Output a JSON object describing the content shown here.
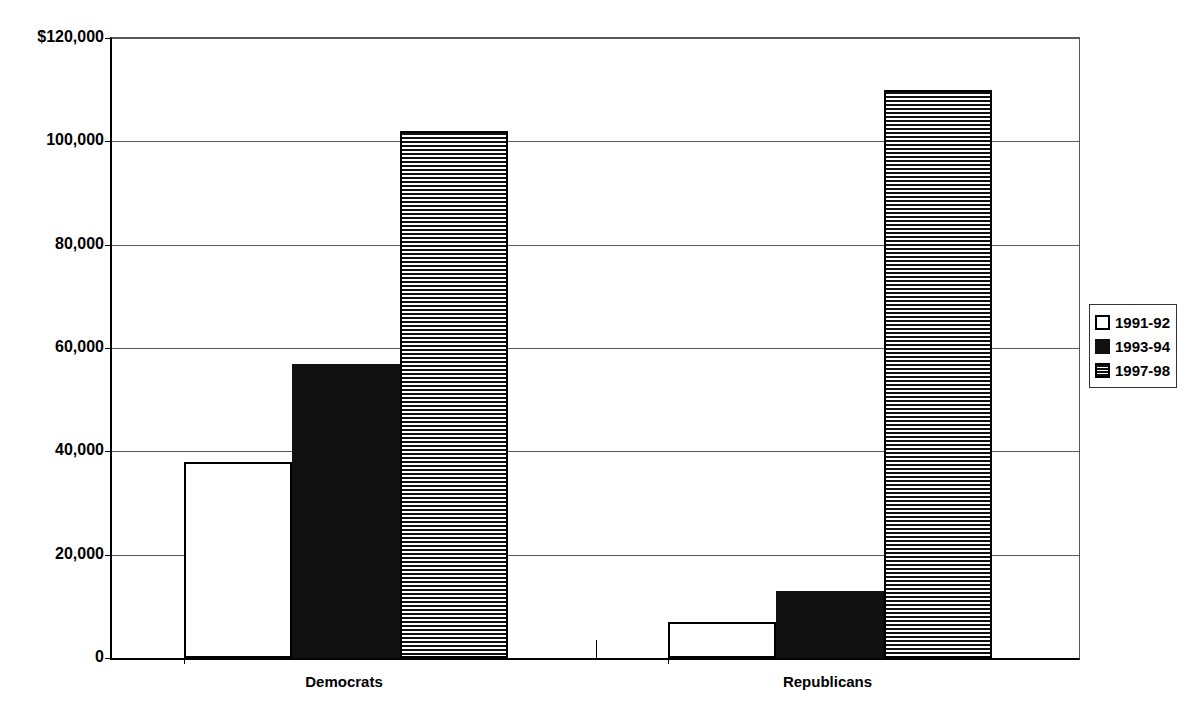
{
  "chart_data": {
    "type": "bar",
    "title": "",
    "subtitle": "",
    "xlabel": "",
    "ylabel": "",
    "categories": [
      "Democrats",
      "Republicans"
    ],
    "series": [
      {
        "name": "1991-92",
        "pattern": "open",
        "values": [
          38000,
          7000
        ]
      },
      {
        "name": "1993-94",
        "pattern": "solid",
        "values": [
          57000,
          13000
        ]
      },
      {
        "name": "1997-98",
        "pattern": "hstripe",
        "values": [
          102000,
          110000
        ]
      }
    ],
    "ylim": [
      0,
      120000
    ],
    "ytick_values": [
      0,
      20000,
      40000,
      60000,
      80000,
      100000,
      120000
    ],
    "ytick_labels": [
      "0",
      "20,000",
      "40,000",
      "60,000",
      "80,000",
      "100,000",
      "$120,000"
    ],
    "grid": true,
    "grid_axis": "y",
    "legend_position": "right",
    "colors": {
      "axis": "#000000",
      "gridline": "#5a5a5a",
      "bar_outline": "#000000",
      "bar_solid_fill": "#111111",
      "bar_open_fill": "#ffffff",
      "background": "#ffffff"
    }
  },
  "legend": {
    "entries": [
      {
        "label": "1991-92",
        "pattern": "open"
      },
      {
        "label": "1993-94",
        "pattern": "solid"
      },
      {
        "label": "1997-98",
        "pattern": "hstripe"
      }
    ]
  },
  "axis": {
    "y_labels": [
      "$120,000",
      "100,000",
      "80,000",
      "60,000",
      "40,000",
      "20,000",
      "0"
    ]
  },
  "x_categories": [
    {
      "label": "Democrats"
    },
    {
      "label": "Republicans"
    }
  ]
}
